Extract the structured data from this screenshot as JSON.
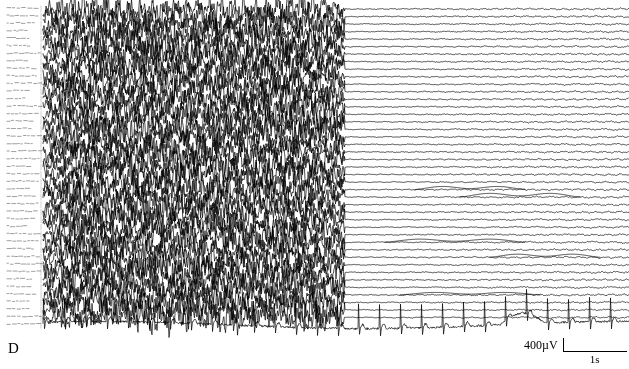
{
  "figure": {
    "panel_label": "D",
    "type": "eeg-recording"
  },
  "calibration": {
    "voltage": "400µV",
    "time": "1s"
  },
  "channels": {
    "count": 43,
    "eeg_count": 42,
    "ecg_label": "ECG",
    "labels": [
      "Fp1-F7",
      "F7-T3",
      "T3-T5",
      "T5-O1",
      "Fp2-F8",
      "F8-T4",
      "T4-T6",
      "T6-O2",
      "Fp1-F3",
      "F3-C3",
      "C3-P3",
      "P3-O1",
      "Fp2-F4",
      "F4-C4",
      "C4-P4",
      "P4-O2",
      "Fz-Cz",
      "Cz-Pz",
      "T3-C3",
      "C3-Cz",
      "Cz-C4",
      "C4-T4",
      "A1-T3",
      "T4-A2",
      "Fp1-A1",
      "Fp2-A2",
      "F7-A1",
      "F8-A2",
      "T5-A1",
      "T6-A2",
      "O1-A1",
      "O2-A2",
      "F3-Fz",
      "Fz-F4",
      "P3-Pz",
      "Pz-P4",
      "T1-T3",
      "T4-T2",
      "Sp1-Sp2",
      "Fp1-Fp2",
      "O1-O2",
      "EMG",
      "ECG"
    ]
  },
  "chart_data": {
    "type": "line",
    "title": "",
    "xlabel": "",
    "ylabel": "",
    "traces": 43,
    "x_range_seconds": [
      0,
      24
    ],
    "amplitude_scale_uv": 400,
    "time_scale_seconds": 1,
    "regions": [
      {
        "name": "ictal-seizure-discharge",
        "x_start_px": 45,
        "x_end_px": 345,
        "description": "high-amplitude rhythmic polyspike seizure activity across all EEG channels"
      },
      {
        "name": "postictal-suppression",
        "x_start_px": 345,
        "x_end_px": 629,
        "description": "abrupt generalized voltage attenuation / flattening after seizure offset"
      }
    ],
    "ecg": {
      "present": true,
      "row_index": 42,
      "rhythm": "regular",
      "qrs_interval_px": 21,
      "description": "bottom channel shows regular QRS complexes across entire epoch"
    }
  }
}
